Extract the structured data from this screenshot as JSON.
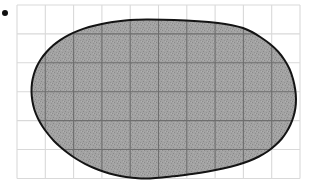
{
  "figure": {
    "kind": "area-estimation-grid-blob",
    "caption_bullet": "•",
    "canvas": {
      "width": 327,
      "height": 193,
      "background": "#ffffff"
    }
  },
  "bullet_marker": {
    "name": "bullet-point",
    "cx": 5.0,
    "cy": 13.0,
    "r": 3.0,
    "color": "#111111"
  },
  "grid": {
    "x0": 17.0,
    "y0": 5.0,
    "x1": 300.0,
    "y1": 178.5,
    "columns": 10,
    "rows": 6,
    "cell_width": 28.3,
    "cell_height": 28.9,
    "line_color_outside": "#d9d9d9",
    "line_color_inside": "#6e6e6e",
    "line_width": 1.1,
    "vertical_lines": [
      17.0,
      45.3,
      73.6,
      101.9,
      130.2,
      158.5,
      186.8,
      215.1,
      243.4,
      271.7,
      300.0
    ],
    "horizontal_lines": [
      5.0,
      33.9,
      62.8,
      91.7,
      120.6,
      149.5,
      178.5
    ]
  },
  "shape": {
    "name": "shaded-blob",
    "fill_color": "#9c9c9c",
    "fill_texture": "stipple",
    "stroke_color": "#141414",
    "stroke_width": 2.0,
    "bounds": {
      "left": 31.5,
      "top": 19.5,
      "right": 296.0,
      "bottom": 178.5
    },
    "outline_points": [
      [
        148.0,
        19.6
      ],
      [
        174.0,
        20.0
      ],
      [
        198.0,
        21.2
      ],
      [
        218.0,
        23.0
      ],
      [
        232.0,
        25.2
      ],
      [
        243.0,
        28.0
      ],
      [
        252.0,
        32.0
      ],
      [
        261.0,
        37.5
      ],
      [
        270.0,
        44.0
      ],
      [
        278.0,
        51.5
      ],
      [
        284.5,
        60.0
      ],
      [
        289.5,
        69.0
      ],
      [
        293.0,
        79.0
      ],
      [
        295.2,
        89.5
      ],
      [
        296.0,
        99.0
      ],
      [
        295.4,
        108.0
      ],
      [
        293.5,
        116.5
      ],
      [
        290.5,
        124.5
      ],
      [
        286.5,
        132.0
      ],
      [
        281.5,
        139.0
      ],
      [
        275.0,
        145.5
      ],
      [
        267.5,
        151.5
      ],
      [
        259.0,
        156.5
      ],
      [
        249.0,
        161.0
      ],
      [
        237.0,
        165.0
      ],
      [
        223.0,
        168.5
      ],
      [
        208.0,
        171.5
      ],
      [
        192.0,
        174.0
      ],
      [
        176.0,
        176.0
      ],
      [
        162.0,
        177.6
      ],
      [
        150.0,
        178.4
      ],
      [
        138.0,
        178.3
      ],
      [
        126.0,
        177.0
      ],
      [
        114.5,
        174.8
      ],
      [
        104.0,
        171.8
      ],
      [
        94.0,
        168.0
      ],
      [
        85.0,
        163.8
      ],
      [
        76.5,
        159.0
      ],
      [
        68.5,
        153.5
      ],
      [
        61.0,
        147.5
      ],
      [
        54.0,
        141.0
      ],
      [
        48.0,
        134.0
      ],
      [
        42.5,
        126.5
      ],
      [
        38.0,
        118.5
      ],
      [
        34.5,
        110.0
      ],
      [
        32.4,
        101.0
      ],
      [
        31.5,
        92.0
      ],
      [
        32.0,
        83.0
      ],
      [
        33.8,
        74.5
      ],
      [
        36.8,
        66.5
      ],
      [
        41.0,
        59.0
      ],
      [
        46.5,
        52.0
      ],
      [
        53.0,
        45.5
      ],
      [
        60.5,
        39.8
      ],
      [
        69.0,
        34.8
      ],
      [
        78.5,
        30.6
      ],
      [
        89.0,
        27.0
      ],
      [
        100.5,
        24.2
      ],
      [
        112.5,
        22.0
      ],
      [
        125.0,
        20.5
      ],
      [
        137.0,
        19.8
      ]
    ]
  },
  "chart_data": {
    "type": "area",
    "title": "",
    "xlabel": "",
    "ylabel": "",
    "grid": true,
    "legend": "none",
    "grid_columns": 10,
    "grid_rows": 6,
    "cell_size_px": 28.3,
    "shape_bbox_cells": {
      "x": [
        0.51,
        9.86
      ],
      "y": [
        0.5,
        6.0
      ]
    },
    "approx_area_cells": 41
  }
}
